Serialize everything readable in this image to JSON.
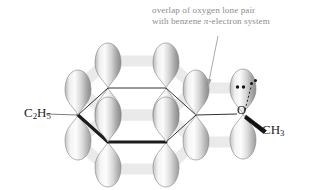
{
  "figure": {
    "background_color": "#ffffff",
    "annotation": {
      "name": "overlap-annotation",
      "line1": "overlap of oxygen lone pair",
      "line2_prefix": "with benzene ",
      "line2_greek": "π",
      "line2_suffix": "-electron system",
      "text_color": "#8d8d8d",
      "pointer": {
        "name": "annotation-arrow",
        "from_x": 218,
        "from_y": 36,
        "to_x": 208,
        "to_y": 84,
        "color": "#9a9a9a"
      }
    },
    "labels": [
      {
        "name": "ethyl-substituent-label",
        "element": "C",
        "sub1": "2",
        "element2": "H",
        "sub2": "5",
        "text": "C2H5"
      },
      {
        "name": "oxygen-atom-label",
        "text": "O"
      },
      {
        "name": "methyl-substituent-label",
        "element": "C",
        "element2": "H",
        "sub2": "3",
        "text": "CH3"
      }
    ],
    "molecule": {
      "ring_name": "benzene-ring",
      "ring_vertices": [
        {
          "name": "ring-vertex-left",
          "x": 78,
          "y": 115
        },
        {
          "name": "ring-vertex-top-left",
          "x": 108,
          "y": 88
        },
        {
          "name": "ring-vertex-top-right",
          "x": 166,
          "y": 88
        },
        {
          "name": "ring-vertex-right",
          "x": 196,
          "y": 115
        },
        {
          "name": "ring-vertex-bottom-right",
          "x": 166,
          "y": 142
        },
        {
          "name": "ring-vertex-bottom-left",
          "x": 108,
          "y": 142
        }
      ],
      "bold_edges": [
        [
          5,
          4
        ],
        [
          0,
          5
        ]
      ],
      "p_orbitals": [
        {
          "name": "p-orbital-left",
          "cx": 78,
          "cy": 115,
          "h": 46,
          "w": 26
        },
        {
          "name": "p-orbital-top-left",
          "cx": 108,
          "cy": 88,
          "h": 46,
          "w": 26
        },
        {
          "name": "p-orbital-top-right",
          "cx": 166,
          "cy": 88,
          "h": 46,
          "w": 26
        },
        {
          "name": "p-orbital-right",
          "cx": 196,
          "cy": 115,
          "h": 46,
          "w": 26
        },
        {
          "name": "p-orbital-bottom-right",
          "cx": 166,
          "cy": 142,
          "h": 46,
          "w": 26
        },
        {
          "name": "p-orbital-bottom-left",
          "cx": 108,
          "cy": 142,
          "h": 46,
          "w": 26
        },
        {
          "name": "p-orbital-oxygen",
          "cx": 243,
          "cy": 114,
          "h": 44,
          "w": 25
        }
      ],
      "oxygen": {
        "name": "oxygen-atom",
        "x": 243,
        "y": 114,
        "lone_pair_on_top": {
          "name": "oxygen-lone-pair-dots",
          "x": 239,
          "y": 87
        },
        "lone_pair_offset": {
          "name": "oxygen-lone-pair-offset-dots",
          "x": 254,
          "y": 82
        },
        "dotted_bond": {
          "name": "lone-pair-dotted-line",
          "x1": 245,
          "y1": 108,
          "x2": 252,
          "y2": 86
        }
      },
      "bonds": [
        {
          "name": "bond-ethyl-to-ring",
          "type": "plain",
          "x1": 46,
          "y1": 114,
          "x2": 78,
          "y2": 115
        },
        {
          "name": "bond-ring-to-oxygen",
          "type": "plain",
          "x1": 196,
          "y1": 115,
          "x2": 237,
          "y2": 114
        },
        {
          "name": "bond-oxygen-to-methyl",
          "type": "wedge",
          "x1": 247,
          "y1": 117,
          "x2": 266,
          "y2": 131
        }
      ],
      "pi_cloud": {
        "name": "pi-electron-cloud-bands",
        "color": "#e9e9e9",
        "description": "pale grey bands linking adjacent p-orbital lobes above and below the ring plane"
      },
      "orbital_fill": {
        "highlight": "#fdfdfd",
        "mid": "#c9c9c9",
        "shadow": "#8f8f8f",
        "outline": "#7c7c7c"
      },
      "bond_color": "#1c1c1c"
    }
  }
}
